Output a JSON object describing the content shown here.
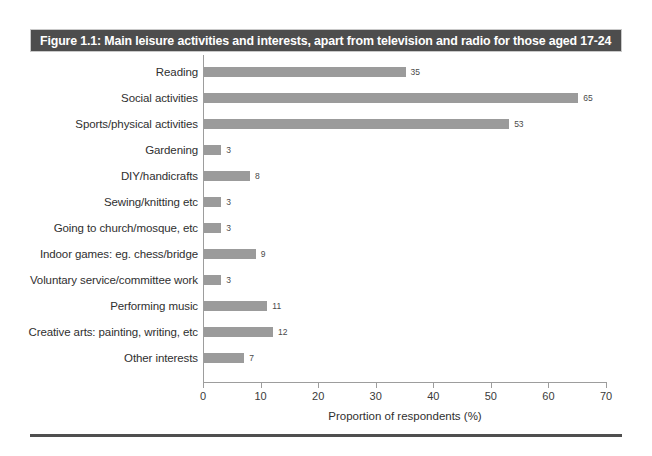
{
  "figure": {
    "title": "Figure 1.1: Main leisure activities and interests, apart from television and radio for those aged 17-24",
    "title_bg": "#4d4d4d",
    "title_color": "#ffffff",
    "bar_color": "#9b9b9b",
    "axis_color": "#9d9d9d",
    "rule_color": "#4f4f4f"
  },
  "chart_data": {
    "type": "bar",
    "orientation": "horizontal",
    "title": "Figure 1.1: Main leisure activities and interests, apart from television and radio for those aged 17-24",
    "xlabel": "Proportion of respondents (%)",
    "ylabel": "",
    "xlim": [
      0,
      70
    ],
    "xticks": [
      0,
      10,
      20,
      30,
      40,
      50,
      60,
      70
    ],
    "xtick_labels": [
      "0",
      "10",
      "20",
      "30",
      "40",
      "50",
      "60",
      "70"
    ],
    "grid": false,
    "legend": null,
    "data_labels": true,
    "categories": [
      "Reading",
      "Social activities",
      "Sports/physical activities",
      "Gardening",
      "DIY/handicrafts",
      "Sewing/knitting etc",
      "Going to church/mosque, etc",
      "Indoor games: eg. chess/bridge",
      "Voluntary service/committee work",
      "Performing music",
      "Creative arts: painting, writing, etc",
      "Other interests"
    ],
    "values": [
      35,
      65,
      53,
      3,
      8,
      3,
      3,
      9,
      3,
      11,
      12,
      7
    ],
    "value_labels": [
      "35",
      "65",
      "53",
      "3",
      "8",
      "3",
      "3",
      "9",
      "3",
      "11",
      "12",
      "7"
    ]
  }
}
